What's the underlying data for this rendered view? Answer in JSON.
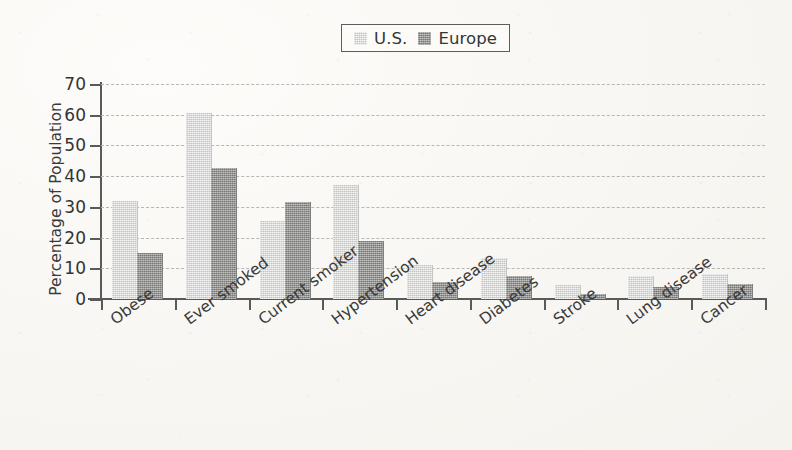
{
  "chart_data": {
    "type": "bar",
    "title": "",
    "xlabel": "",
    "ylabel": "Percentage of Population",
    "ylim": [
      0,
      70
    ],
    "ytick_values": [
      70,
      60,
      50,
      40,
      30,
      20,
      10,
      0
    ],
    "grid": true,
    "legend_position": "top-center",
    "categories": [
      "Obese",
      "Ever smoked",
      "Current smoker",
      "Hypertension",
      "Heart disease",
      "Diabetes",
      "Stroke",
      "Lung disease",
      "Cancer"
    ],
    "series": [
      {
        "name": "U.S.",
        "color": "#d3d3d1",
        "values": [
          32,
          60.5,
          25.5,
          37,
          11,
          13.5,
          4.5,
          7.5,
          8
        ]
      },
      {
        "name": "Europe",
        "color": "#8f8f8d",
        "values": [
          15,
          42.5,
          31.5,
          19,
          5.5,
          7.5,
          1.5,
          4,
          5
        ]
      }
    ]
  },
  "legend": {
    "entries": [
      {
        "label": "U.S.",
        "swatch": "us-swatch-icon"
      },
      {
        "label": "Europe",
        "swatch": "europe-swatch-icon"
      }
    ]
  }
}
